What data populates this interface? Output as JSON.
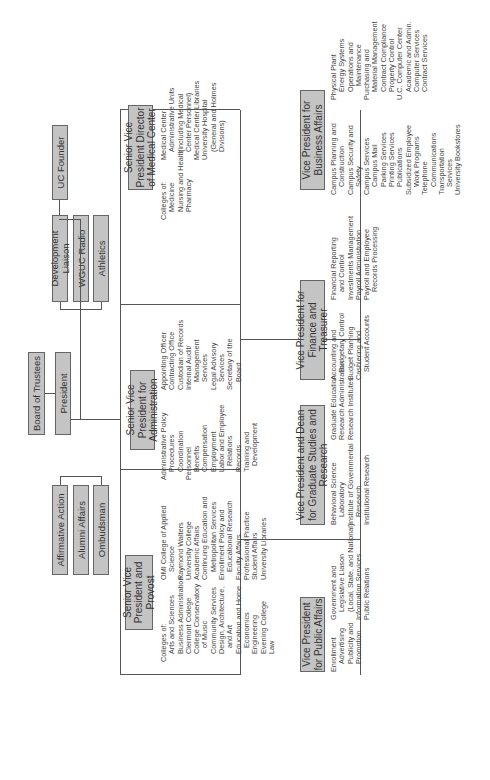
{
  "top": {
    "board": "Board of Trustees",
    "president": "President",
    "uc_founder": "UC Founder",
    "staff_right": [
      "Development Liaison",
      "WGUC Radio",
      "Athletics"
    ],
    "staff_left": [
      "Affirmative Action",
      "Alumni Affairs",
      "Ombudsman"
    ]
  },
  "units": {
    "provost": {
      "title": "Senior Vice President and Provost",
      "left": [
        "Colleges of:",
        "  Arts and Sciences",
        "  Business Administration",
        "  Clermont College",
        "  College Conservatory",
        "    of Music",
        "  Community Services",
        "  Design, Architecture,",
        "    and Art",
        "  Education and Home",
        "    Economics",
        "  Engineering",
        "  Evening College",
        "  Law"
      ],
      "right": [
        "OMI College of Applied",
        "  Science",
        "Raymond Walters",
        "University College",
        "Academic Affairs",
        "Continuing Education and",
        "  Metropolitan Services",
        "Enrollment Policy and",
        "  Educational Research",
        "Faculty Affairs",
        "Professional Practice",
        "Student Affairs",
        "University Libraries"
      ]
    },
    "administration": {
      "title": "Senior Vice President for Administration",
      "left": [
        "Administrative Policy",
        "  Procedures",
        "  Coordination",
        "Personnel",
        "  Benefits",
        "  Compensation",
        "  Employment",
        "  Labor and Employee",
        "    Relations",
        "  Records",
        "  Training and",
        "    Development"
      ],
      "right": [
        "Appointing Officer",
        "Contracting Office",
        "Custodian of Records",
        "Internal Audit/",
        "  Management",
        "  Services",
        "Legal Advisory",
        "  Services",
        "Secretary of the",
        "  Board"
      ]
    },
    "medical": {
      "title": "Senior Vice President Director of Medical Center",
      "left": [
        "Colleges of:",
        "  Medicine",
        "  Nursing and Health",
        "  Pharmacy"
      ],
      "right": [
        "Medical Center",
        "  Administrative Units",
        "  (including Medical",
        "  Center Personnel)",
        "Medical Center Libraries",
        "University Hospital",
        "  (General and Holmes",
        "  Divisions)"
      ]
    },
    "public_affairs": {
      "title": "Vice President for Public Affairs",
      "left": [
        "Enrollment",
        "  Advertising",
        "  Publicity and",
        "  Promotion"
      ],
      "right": [
        "Government and",
        "  Legislative Liason",
        "  (Local, State, and National)",
        "Information Services",
        "Public Relations"
      ]
    },
    "graduate": {
      "title": "Vice President and Dean for Graduate Studies and Research",
      "left": [
        "Behavioral Science",
        "  Laboratory",
        "Institute of Governmental",
        "  Research",
        "Institutional Research"
      ],
      "right": [
        "Graduate Education",
        "Research Administration",
        "Research Institutes"
      ]
    },
    "finance": {
      "title": "Vice President for Finance and Treasurer",
      "left": [
        "Accounting and",
        "  Budgetary Control",
        "Budget Planning",
        "Cashiering and",
        "  Student Accounts"
      ],
      "right": [
        "Financial Reporting",
        "  and Control",
        "Investments Management",
        "Payroll Administration",
        "Payroll and Employee",
        "  Records Processing"
      ]
    },
    "business": {
      "title": "Vice President for Business Affairs",
      "left": [
        "Campus Planning and",
        "  Construction",
        "Campus Security and",
        "  Safety",
        "Campus Services",
        "  Campus Mail",
        "  Parking Services",
        "  Printing Services",
        "  Publications",
        "Subsidized Employee",
        "  Work Programs",
        "Telephone",
        "  Communications",
        "Transportation",
        "  Services",
        "University Bookstores"
      ],
      "right": [
        "Physical Plant",
        "  Energy Systems",
        "  Operations and",
        "    Maintenance",
        "Purchasing and",
        "  Material Management",
        "  Contract Compliance",
        "  Property Control",
        "U.C. Computer Center",
        "  Academic and Admin.",
        "  Computer Services",
        "  Contract Services"
      ]
    }
  }
}
